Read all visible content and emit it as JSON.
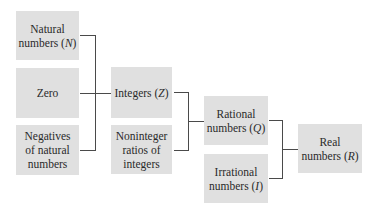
{
  "diagram": {
    "nodes": {
      "natural": {
        "line1": "Natural",
        "line2_prefix": "numbers (",
        "symbol": "N",
        "line2_suffix": ")"
      },
      "zero": {
        "line1": "Zero"
      },
      "negatives": {
        "line1": "Negatives",
        "line2": "of natural",
        "line3": "numbers"
      },
      "integers": {
        "line1_prefix": "Integers (",
        "symbol": "Z",
        "line1_suffix": ")"
      },
      "noninteger": {
        "line1": "Noninteger",
        "line2": "ratios of",
        "line3": "integers"
      },
      "rational": {
        "line1": "Rational",
        "line2_prefix": "numbers (",
        "symbol": "Q",
        "line2_suffix": ")"
      },
      "irrational": {
        "line1": "Irrational",
        "line2_prefix": "numbers (",
        "symbol": "I",
        "line2_suffix": ")"
      },
      "real": {
        "line1": "Real",
        "line2_prefix": "numbers (",
        "symbol": "R",
        "line2_suffix": ")"
      }
    },
    "edges": [
      [
        "natural",
        "integers"
      ],
      [
        "zero",
        "integers"
      ],
      [
        "negatives",
        "integers"
      ],
      [
        "integers",
        "rational"
      ],
      [
        "noninteger",
        "rational"
      ],
      [
        "rational",
        "real"
      ],
      [
        "irrational",
        "real"
      ]
    ],
    "colors": {
      "box_fill": "#e0e0e0",
      "text": "#2a2a2a",
      "line": "#4a4a4a"
    }
  }
}
